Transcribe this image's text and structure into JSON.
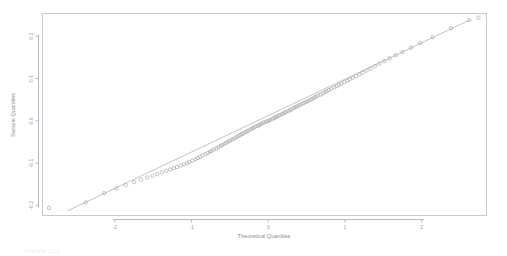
{
  "chart_data": {
    "type": "scatter",
    "title": "",
    "subtitle": "",
    "xlabel": "Theoretical Quantiles",
    "ylabel": "Sample Quantiles",
    "xlim": [
      -2.95,
      2.85
    ],
    "ylim": [
      -0.225,
      0.255
    ],
    "xticks": [
      -2,
      -1,
      0,
      1,
      2
    ],
    "xticklabels": [
      "-2",
      "-1",
      "0",
      "1",
      "2"
    ],
    "yticks": [
      -0.2,
      -0.1,
      0.0,
      0.1,
      0.2
    ],
    "yticklabels": [
      "-0.2",
      "-0.1",
      "0.0",
      "0.1",
      "0.2"
    ],
    "grid": false,
    "legend": null,
    "marker": "open-circle",
    "point_color": "#9b9ba3",
    "line_color": "#a9a9b2",
    "panel_border_color": "#c9c9cf",
    "reference_line": {
      "name": "qq-reference-line",
      "x": [
        -2.62,
        2.62
      ],
      "y": [
        -0.213,
        0.238
      ]
    },
    "series": [
      {
        "name": "sample-vs-theoretical",
        "x": [
          -2.86,
          -2.38,
          -2.14,
          -1.98,
          -1.86,
          -1.75,
          -1.66,
          -1.58,
          -1.51,
          -1.45,
          -1.39,
          -1.33,
          -1.28,
          -1.23,
          -1.19,
          -1.14,
          -1.1,
          -1.06,
          -1.03,
          -0.99,
          -0.95,
          -0.92,
          -0.89,
          -0.86,
          -0.82,
          -0.79,
          -0.76,
          -0.74,
          -0.71,
          -0.68,
          -0.65,
          -0.62,
          -0.6,
          -0.57,
          -0.55,
          -0.52,
          -0.5,
          -0.47,
          -0.45,
          -0.42,
          -0.4,
          -0.37,
          -0.35,
          -0.33,
          -0.3,
          -0.28,
          -0.26,
          -0.23,
          -0.21,
          -0.19,
          -0.17,
          -0.14,
          -0.12,
          -0.1,
          -0.08,
          -0.06,
          -0.03,
          -0.01,
          0.01,
          0.03,
          0.06,
          0.08,
          0.1,
          0.12,
          0.14,
          0.17,
          0.19,
          0.21,
          0.23,
          0.26,
          0.28,
          0.3,
          0.33,
          0.35,
          0.37,
          0.4,
          0.42,
          0.45,
          0.47,
          0.5,
          0.52,
          0.55,
          0.57,
          0.6,
          0.62,
          0.65,
          0.68,
          0.71,
          0.74,
          0.76,
          0.79,
          0.82,
          0.86,
          0.89,
          0.92,
          0.95,
          0.99,
          1.03,
          1.06,
          1.1,
          1.14,
          1.19,
          1.23,
          1.28,
          1.33,
          1.39,
          1.45,
          1.51,
          1.58,
          1.66,
          1.75,
          1.86,
          1.98,
          2.14,
          2.38,
          2.62,
          2.74
        ],
        "y": [
          -0.206,
          -0.193,
          -0.171,
          -0.16,
          -0.152,
          -0.145,
          -0.139,
          -0.134,
          -0.13,
          -0.126,
          -0.122,
          -0.118,
          -0.115,
          -0.112,
          -0.109,
          -0.106,
          -0.103,
          -0.1,
          -0.097,
          -0.094,
          -0.091,
          -0.088,
          -0.085,
          -0.082,
          -0.079,
          -0.076,
          -0.073,
          -0.071,
          -0.068,
          -0.065,
          -0.062,
          -0.059,
          -0.057,
          -0.054,
          -0.052,
          -0.049,
          -0.047,
          -0.044,
          -0.042,
          -0.039,
          -0.037,
          -0.034,
          -0.032,
          -0.03,
          -0.027,
          -0.025,
          -0.023,
          -0.02,
          -0.018,
          -0.016,
          -0.014,
          -0.012,
          -0.01,
          -0.008,
          -0.006,
          -0.004,
          -0.002,
          -0.001,
          0.001,
          0.003,
          0.005,
          0.007,
          0.009,
          0.011,
          0.013,
          0.015,
          0.017,
          0.019,
          0.021,
          0.023,
          0.025,
          0.027,
          0.03,
          0.032,
          0.034,
          0.036,
          0.038,
          0.041,
          0.043,
          0.045,
          0.047,
          0.05,
          0.052,
          0.055,
          0.057,
          0.06,
          0.062,
          0.065,
          0.068,
          0.07,
          0.073,
          0.076,
          0.079,
          0.082,
          0.085,
          0.088,
          0.092,
          0.095,
          0.098,
          0.102,
          0.106,
          0.11,
          0.114,
          0.119,
          0.124,
          0.129,
          0.135,
          0.141,
          0.148,
          0.155,
          0.163,
          0.173,
          0.184,
          0.198,
          0.219,
          0.238,
          0.244
        ]
      }
    ]
  },
  "caption": {
    "text": "FIGURE 12.1"
  }
}
